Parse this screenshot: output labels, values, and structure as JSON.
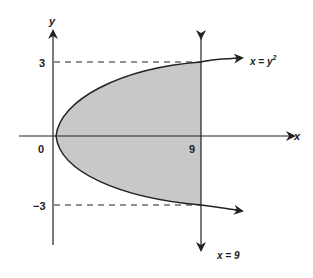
{
  "diagram": {
    "axes": {
      "x_label": "x",
      "y_label": "y"
    },
    "ticks": {
      "origin": "0",
      "x_nine": "9",
      "y_three": "3",
      "y_neg_three": "−3"
    },
    "curves": {
      "parabola_label": "x = y",
      "parabola_exponent": "2",
      "vertical_line_label": "x = 9"
    },
    "region": {
      "fill": "#c8c8c8",
      "description": "Region bounded by x = y^2 and x = 9"
    },
    "colors": {
      "stroke": "#222222",
      "shade": "#c8c8c8"
    }
  }
}
